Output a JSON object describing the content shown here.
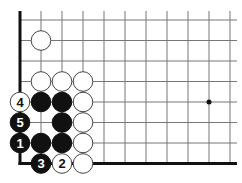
{
  "board": {
    "grid": {
      "origin_x": 20,
      "origin_y": 20,
      "spacing_x": 21,
      "spacing_y": 20.5,
      "cols": 11,
      "rows": 8,
      "right_extent": 237,
      "top_extent": 11,
      "line_color": "#777777",
      "edge_color": "#111111"
    },
    "edges": [
      "left",
      "bottom"
    ],
    "star_points": [
      {
        "col": 9,
        "row": 4
      }
    ],
    "stones": [
      {
        "color": "white",
        "col": 1,
        "row": 1,
        "label": ""
      },
      {
        "color": "white",
        "col": 1,
        "row": 3,
        "label": ""
      },
      {
        "color": "white",
        "col": 2,
        "row": 3,
        "label": ""
      },
      {
        "color": "white",
        "col": 3,
        "row": 3,
        "label": ""
      },
      {
        "color": "white",
        "col": 0,
        "row": 4,
        "label": "4"
      },
      {
        "color": "black",
        "col": 1,
        "row": 4,
        "label": ""
      },
      {
        "color": "black",
        "col": 2,
        "row": 4,
        "label": ""
      },
      {
        "color": "white",
        "col": 3,
        "row": 4,
        "label": ""
      },
      {
        "color": "black",
        "col": 0,
        "row": 5,
        "label": "5"
      },
      {
        "color": "black",
        "col": 2,
        "row": 5,
        "label": ""
      },
      {
        "color": "white",
        "col": 3,
        "row": 5,
        "label": ""
      },
      {
        "color": "black",
        "col": 0,
        "row": 6,
        "label": "1"
      },
      {
        "color": "black",
        "col": 1,
        "row": 6,
        "label": ""
      },
      {
        "color": "black",
        "col": 2,
        "row": 6,
        "label": ""
      },
      {
        "color": "white",
        "col": 3,
        "row": 6,
        "label": ""
      },
      {
        "color": "black",
        "col": 1,
        "row": 7,
        "label": "3"
      },
      {
        "color": "white",
        "col": 2,
        "row": 7,
        "label": "2"
      },
      {
        "color": "white",
        "col": 3,
        "row": 7,
        "label": ""
      }
    ]
  }
}
